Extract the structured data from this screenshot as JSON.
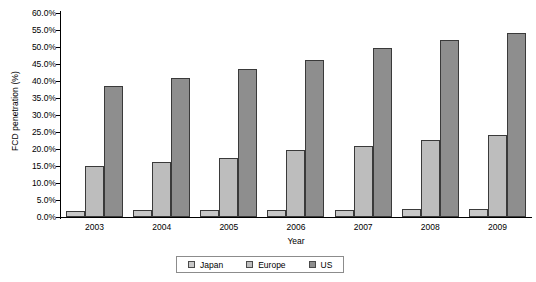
{
  "chart_data": {
    "type": "bar",
    "title": "",
    "xlabel": "Year",
    "ylabel": "FCD penetration (%)",
    "categories": [
      "2003",
      "2004",
      "2005",
      "2006",
      "2007",
      "2008",
      "2009"
    ],
    "series": [
      {
        "name": "Japan",
        "color": "#c8c8c8",
        "values": [
          1.8,
          2.0,
          2.0,
          2.1,
          2.2,
          2.3,
          2.5
        ]
      },
      {
        "name": "Europe",
        "color": "#bdbdbd",
        "values": [
          15.0,
          16.2,
          17.5,
          19.6,
          21.0,
          22.7,
          24.2
        ]
      },
      {
        "name": "US",
        "color": "#8e8e8e",
        "values": [
          38.5,
          40.8,
          43.5,
          46.2,
          49.8,
          52.0,
          54.2
        ]
      }
    ],
    "ylim": [
      0,
      60
    ],
    "ytick_step": 5,
    "ytick_labels": [
      "60.0%",
      "55.0%",
      "50.0%",
      "45.0%",
      "40.0%",
      "35.0%",
      "30.0%",
      "25.0%",
      "20.0%",
      "15.0%",
      "10.0%",
      "5.0%",
      "0.0%"
    ],
    "ytick_values": [
      60,
      55,
      50,
      45,
      40,
      35,
      30,
      25,
      20,
      15,
      10,
      5,
      0
    ],
    "grid": false,
    "legend_position": "bottom"
  }
}
